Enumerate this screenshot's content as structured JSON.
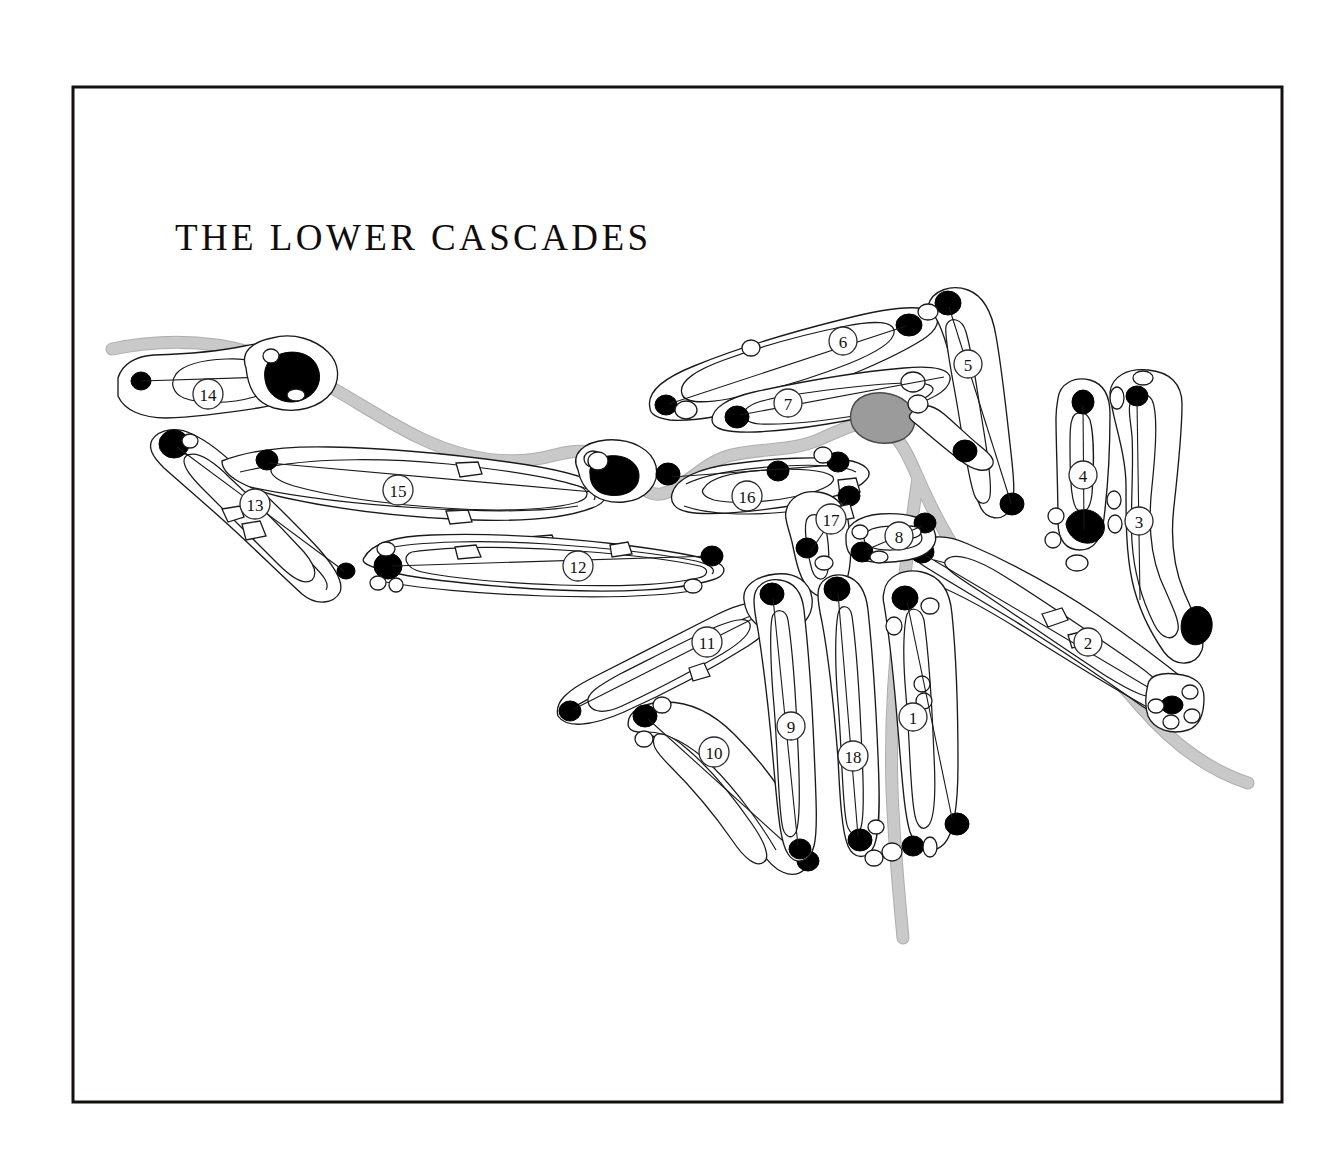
{
  "document": {
    "type": "golf-course-routing-map",
    "title": "THE LOWER CASCADES",
    "background_color": "#ffffff",
    "frame": {
      "color": "#14100f",
      "x": 73,
      "y": 87,
      "width": 1209,
      "height": 1015
    }
  },
  "legend_colors": {
    "fairway_fill": "#ffffff",
    "outline": "#1a1a1a",
    "bunker_sand": "#000000",
    "bunker_light": "#ffffff",
    "water_pond": "#9b9b9b",
    "creek": "#c9c9c9",
    "creek_edge": "#aeaeae",
    "title_text": "#100d0c"
  },
  "title_position": {
    "x": 175,
    "y": 250
  },
  "holes": [
    {
      "number": "1",
      "marker": {
        "cx": 913,
        "cy": 717
      },
      "region": "lower-center-right"
    },
    {
      "number": "2",
      "marker": {
        "cx": 1088,
        "cy": 642
      },
      "region": "right"
    },
    {
      "number": "3",
      "marker": {
        "cx": 1139,
        "cy": 521
      },
      "region": "far-right"
    },
    {
      "number": "4",
      "marker": {
        "cx": 1083,
        "cy": 475
      },
      "region": "far-right"
    },
    {
      "number": "5",
      "marker": {
        "cx": 968,
        "cy": 364
      },
      "region": "upper-right"
    },
    {
      "number": "6",
      "marker": {
        "cx": 843,
        "cy": 341
      },
      "region": "upper-center"
    },
    {
      "number": "7",
      "marker": {
        "cx": 788,
        "cy": 403
      },
      "region": "upper-center"
    },
    {
      "number": "8",
      "marker": {
        "cx": 899,
        "cy": 536
      },
      "region": "center"
    },
    {
      "number": "9",
      "marker": {
        "cx": 791,
        "cy": 726
      },
      "region": "lower-center"
    },
    {
      "number": "10",
      "marker": {
        "cx": 714,
        "cy": 752
      },
      "region": "lower-left-center"
    },
    {
      "number": "11",
      "marker": {
        "cx": 707,
        "cy": 642
      },
      "region": "center-left"
    },
    {
      "number": "12",
      "marker": {
        "cx": 578,
        "cy": 566
      },
      "region": "mid-left"
    },
    {
      "number": "13",
      "marker": {
        "cx": 255,
        "cy": 504
      },
      "region": "far-left"
    },
    {
      "number": "14",
      "marker": {
        "cx": 208,
        "cy": 394
      },
      "region": "far-left-top"
    },
    {
      "number": "15",
      "marker": {
        "cx": 398,
        "cy": 490
      },
      "region": "left"
    },
    {
      "number": "16",
      "marker": {
        "cx": 747,
        "cy": 496
      },
      "region": "center"
    },
    {
      "number": "17",
      "marker": {
        "cx": 831,
        "cy": 519
      },
      "region": "center"
    },
    {
      "number": "18",
      "marker": {
        "cx": 853,
        "cy": 756
      },
      "region": "lower-center"
    }
  ],
  "features": {
    "water_hazard_pond": {
      "cx": 873,
      "cy": 417,
      "label": "pond"
    },
    "creek_description": "stream running from upper-left across the map to the right edge and down through the lower center",
    "bunker_count_dark": 47,
    "bunker_count_light": 33
  }
}
